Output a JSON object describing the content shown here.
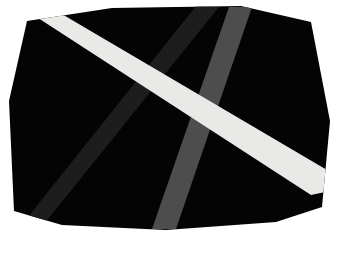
{
  "scene": {
    "title": "Black octagonal panel with three diagonal stripes",
    "canvas": {
      "width": 337,
      "height": 263,
      "background_color": "#ffffff"
    }
  },
  "panel": {
    "name": "black-octagon-panel",
    "fill_color": "#040404",
    "edge_color": "#000000",
    "shape": "octagon",
    "points": "27,21 112,8 241,6 311,22 330,121 322,207 276,222 166,230 62,225 14,211 9,101"
  },
  "stripes": [
    {
      "id": "white-diagonal-stripe",
      "label": "White diagonal stripe",
      "color": "#e9e9e7",
      "direction": "top-left to right-edge",
      "width_px": 16,
      "points": "35,16 55,10 332,173 330,191 311,195"
    },
    {
      "id": "dark-charcoal-stripe",
      "label": "Dark charcoal diagonal stripe",
      "color": "#1d1d1d",
      "direction": "bottom-left to top-edge",
      "width_px": 20,
      "points": "24,222 44,224 219,7 196,6"
    },
    {
      "id": "medium-gray-stripe",
      "label": "Medium gray diagonal stripe",
      "color": "#4d4d4d",
      "direction": "bottom-edge to top-right",
      "width_px": 18,
      "points": "152,229 176,229 252,7 229,7"
    }
  ],
  "legend": {
    "white_label": "white",
    "dark_label": "charcoal",
    "gray_label": "gray"
  }
}
